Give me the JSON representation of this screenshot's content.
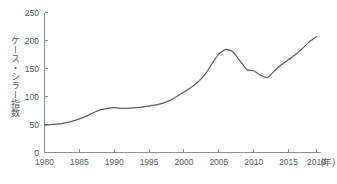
{
  "chart_data": {
    "type": "line",
    "title": "",
    "xlabel": "年",
    "ylabel": "ケース・シラー指数",
    "xlim": [
      1980,
      2019
    ],
    "ylim": [
      0,
      250
    ],
    "grid": false,
    "legend": null,
    "x_tick_labels": [
      "1980",
      "1985",
      "1990",
      "1995",
      "2000",
      "2005",
      "2010",
      "2015",
      "2019"
    ],
    "x_ticks": [
      1980,
      1985,
      1990,
      1995,
      2000,
      2005,
      2010,
      2015,
      2019
    ],
    "y_tick_labels": [
      "0",
      "50",
      "100",
      "150",
      "200",
      "250"
    ],
    "y_ticks": [
      0,
      50,
      100,
      150,
      200,
      250
    ],
    "x_unit_suffix": "(年)",
    "line_color": "#5a5f63",
    "axis_color": "#8a8f93",
    "series": [
      {
        "name": "ケース・シラー指数",
        "x": [
          1980,
          1981,
          1982,
          1983,
          1984,
          1985,
          1986,
          1987,
          1988,
          1989,
          1990,
          1991,
          1992,
          1993,
          1994,
          1995,
          1996,
          1997,
          1998,
          1999,
          2000,
          2001,
          2002,
          2003,
          2004,
          2005,
          2006,
          2007,
          2008,
          2009,
          2010,
          2011,
          2012,
          2013,
          2014,
          2015,
          2016,
          2017,
          2018,
          2019
        ],
        "values": [
          49,
          50,
          51,
          53,
          56,
          60,
          65,
          71,
          76,
          79,
          80,
          79,
          79,
          80,
          81,
          83,
          85,
          88,
          93,
          100,
          108,
          116,
          126,
          139,
          158,
          176,
          184,
          180,
          164,
          148,
          146,
          138,
          134,
          146,
          157,
          166,
          175,
          186,
          198,
          207
        ]
      }
    ]
  }
}
